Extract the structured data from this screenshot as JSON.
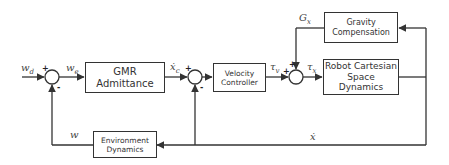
{
  "diagram": {
    "type": "control-block-diagram",
    "blocks": {
      "gmr_admittance": "GMR Admittance",
      "velocity_controller": [
        "Velocity",
        "Controller"
      ],
      "robot_dynamics": [
        "Robot Cartesian",
        "Space Dynamics"
      ],
      "gravity_compensation": [
        "Gravity",
        "Compensation"
      ],
      "environment_dynamics": [
        "Environment",
        "Dynamics"
      ]
    },
    "signals": {
      "w_d": "w_d",
      "w_e": "w_e",
      "x_dot_c": "ẋ_c",
      "tau_v": "τ_v",
      "tau_x": "τ_x",
      "G_x": "G_x",
      "w": "w",
      "x_dot": "ẋ"
    },
    "signs": {
      "sum1": {
        "top": "+",
        "bottom": "-"
      },
      "sum2": {
        "top": "+",
        "bottom": "-"
      },
      "sum3": {
        "top": "+",
        "left": "+"
      }
    },
    "colors": {
      "line": "#333333",
      "text": "#333333",
      "background": "#ffffff"
    }
  }
}
